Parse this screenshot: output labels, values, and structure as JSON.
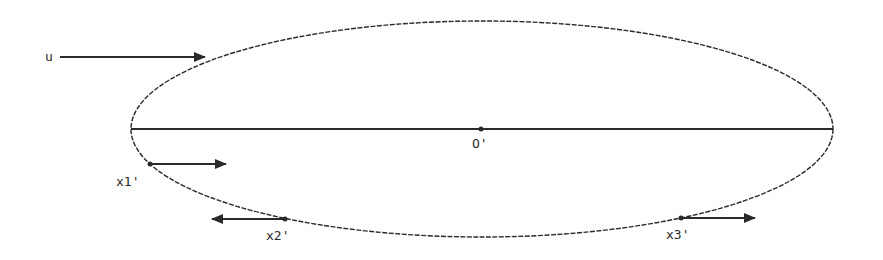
{
  "diagram": {
    "type": "ellipse-flow",
    "colors": {
      "stroke": "#2a2a2a",
      "background": "#ffffff"
    },
    "ellipse": {
      "cx": 482,
      "cy": 129,
      "rx": 351,
      "ry": 108
    },
    "axis": {
      "x1": 131,
      "x2": 833,
      "y": 129
    },
    "labels": {
      "u": "u",
      "origin": "O'",
      "x1": "x1'",
      "x2": "x2'",
      "x3": "x3'"
    },
    "arrows": [
      {
        "name": "u-arrow",
        "from": [
          60,
          57
        ],
        "to": [
          205,
          57
        ],
        "direction": "right"
      },
      {
        "name": "x1-arrow",
        "from": [
          150,
          164
        ],
        "to": [
          226,
          164
        ],
        "direction": "right"
      },
      {
        "name": "x2-arrow",
        "from": [
          285,
          219
        ],
        "to": [
          212,
          219
        ],
        "direction": "left"
      },
      {
        "name": "x3-arrow",
        "from": [
          681,
          218
        ],
        "to": [
          755,
          218
        ],
        "direction": "right"
      }
    ],
    "points": [
      {
        "name": "origin-point",
        "x": 481,
        "y": 129
      },
      {
        "name": "x1-point",
        "x": 150,
        "y": 164
      },
      {
        "name": "x2-point",
        "x": 285,
        "y": 219
      },
      {
        "name": "x3-point",
        "x": 681,
        "y": 218
      }
    ]
  }
}
